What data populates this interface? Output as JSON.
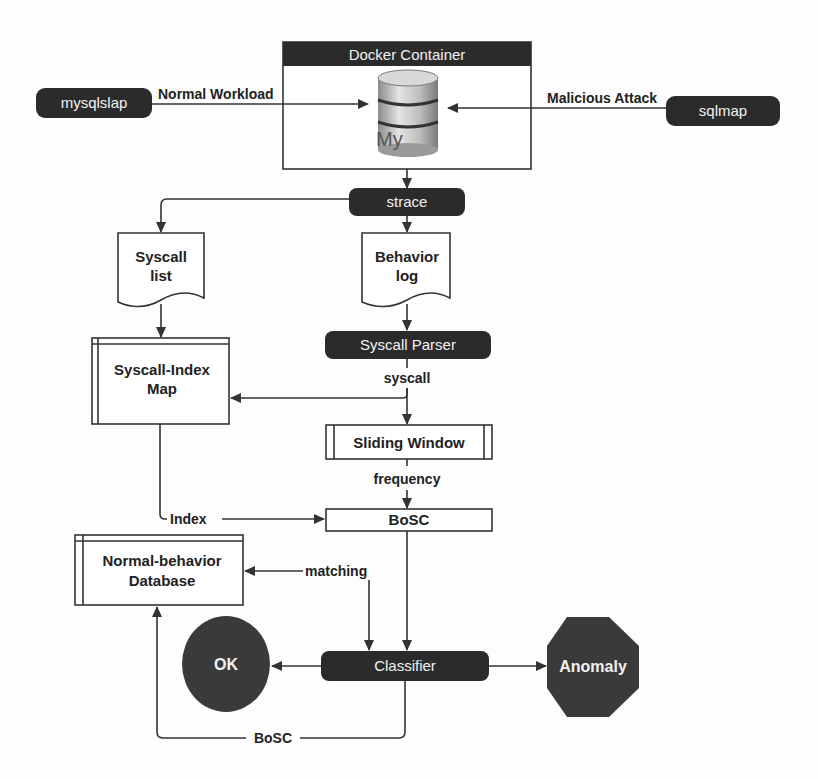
{
  "diagram": {
    "container": {
      "title": "Docker Container",
      "db_label": "My"
    },
    "sources": {
      "left": {
        "label": "mysqlslap",
        "edge_label": "Normal Workload"
      },
      "right": {
        "label": "sqlmap",
        "edge_label": "Malicious Attack"
      }
    },
    "nodes": {
      "strace": "strace",
      "syscall_list": [
        "Syscall",
        "list"
      ],
      "behavior_log": [
        "Behavior",
        "log"
      ],
      "syscall_parser": "Syscall Parser",
      "syscall_index_map": [
        "Syscall-Index",
        "Map"
      ],
      "sliding_window": "Sliding Window",
      "bosc": "BoSC",
      "normal_db": [
        "Normal-behavior",
        "Database"
      ],
      "classifier": "Classifier",
      "ok": "OK",
      "anomaly": "Anomaly"
    },
    "edge_labels": {
      "syscall": "syscall",
      "frequency": "frequency",
      "index": "Index",
      "matching": "matching",
      "bosc_feedback": "BoSC"
    },
    "colors": {
      "dark_node": "#2b2b2b",
      "ok_circle": "#3a3a3a",
      "anomaly_octagon": "#3a3a3a",
      "stroke": "#333333"
    }
  }
}
